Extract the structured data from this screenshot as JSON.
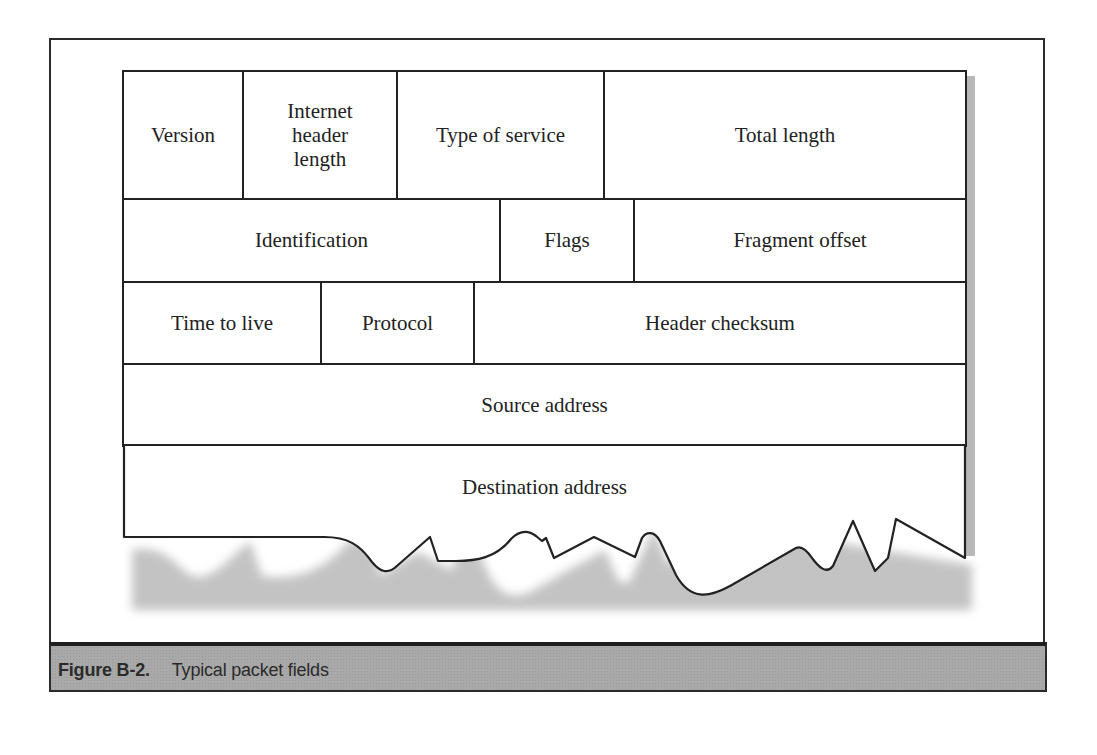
{
  "diagram": {
    "rows": [
      {
        "fields": [
          {
            "label": "Version"
          },
          {
            "label": "Internet header length"
          },
          {
            "label": "Type of service"
          },
          {
            "label": "Total length"
          }
        ]
      },
      {
        "fields": [
          {
            "label": "Identification"
          },
          {
            "label": "Flags"
          },
          {
            "label": "Fragment offset"
          }
        ]
      },
      {
        "fields": [
          {
            "label": "Time to live"
          },
          {
            "label": "Protocol"
          },
          {
            "label": "Header checksum"
          }
        ]
      },
      {
        "fields": [
          {
            "label": "Source address"
          }
        ]
      },
      {
        "fields": [
          {
            "label": "Destination address"
          }
        ]
      }
    ],
    "ihl_lines": [
      "Internet",
      "header",
      "length"
    ],
    "torn_bottom_edge": true
  },
  "caption": {
    "figure_number": "Figure B-2.",
    "text": "Typical packet fields"
  },
  "colors": {
    "border": "#222222",
    "caption_bar": "#a9a9a9",
    "shadow": "#b8b8b8"
  }
}
